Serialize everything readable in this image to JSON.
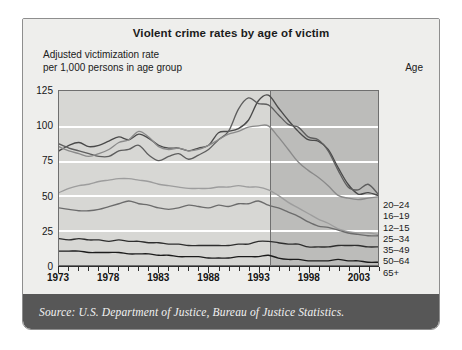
{
  "chart_data": {
    "type": "line",
    "title": "Violent crime rates by age of victim",
    "subtitle": "Adjusted victimization rate\nper 1,000 persons in age group",
    "legend_title": "Age",
    "legend_position": "right",
    "source": "Source: U.S. Department of Justice, Bureau of Justice Statistics.",
    "xlabel": "",
    "ylabel": "Adjusted victimization rate per 1,000 persons in age group",
    "xlim": [
      1973,
      2005
    ],
    "ylim": [
      0,
      125
    ],
    "yticks": [
      0,
      25,
      50,
      75,
      100,
      125
    ],
    "ytick_labels": [
      "0",
      "25",
      "50",
      "75",
      "100",
      "125"
    ],
    "xticks": [
      1973,
      1978,
      1983,
      1988,
      1993,
      1998,
      2003
    ],
    "xtick_labels": [
      "1973",
      "1978",
      "1983",
      "1988",
      "1993",
      "1998",
      "2003"
    ],
    "grid": "horizontal-white",
    "shaded_split_year": 1993,
    "x": [
      1973,
      1974,
      1975,
      1976,
      1977,
      1978,
      1979,
      1980,
      1981,
      1982,
      1983,
      1984,
      1985,
      1986,
      1987,
      1988,
      1989,
      1990,
      1991,
      1992,
      1993,
      1994,
      1995,
      1996,
      1997,
      1998,
      1999,
      2000,
      2001,
      2002,
      2003,
      2004,
      2005
    ],
    "series": [
      {
        "name": "20-24",
        "color": "#4a4a4a",
        "values": [
          82,
          86,
          88,
          85,
          86,
          89,
          92,
          90,
          94,
          91,
          86,
          84,
          84,
          82,
          84,
          86,
          95,
          96,
          98,
          104,
          118,
          122,
          113,
          104,
          96,
          90,
          89,
          83,
          70,
          58,
          51,
          52,
          50
        ]
      },
      {
        "name": "16-19",
        "color": "#5e5e5e",
        "values": [
          87,
          84,
          82,
          80,
          78,
          78,
          82,
          83,
          86,
          79,
          75,
          78,
          80,
          76,
          79,
          83,
          90,
          96,
          112,
          120,
          116,
          115,
          108,
          101,
          99,
          92,
          90,
          82,
          68,
          56,
          54,
          58,
          51
        ]
      },
      {
        "name": "12-15",
        "color": "#8a8a8a",
        "values": [
          85,
          82,
          80,
          78,
          80,
          83,
          88,
          90,
          96,
          92,
          85,
          83,
          84,
          82,
          83,
          86,
          90,
          94,
          96,
          99,
          100,
          100,
          92,
          83,
          74,
          68,
          63,
          57,
          50,
          48,
          47,
          48,
          49
        ]
      },
      {
        "name": "25-34",
        "color": "#9d9d9d",
        "values": [
          52,
          55,
          57,
          58,
          60,
          61,
          62,
          62,
          61,
          60,
          58,
          57,
          56,
          55,
          55,
          55,
          56,
          56,
          57,
          56,
          56,
          54,
          50,
          45,
          41,
          37,
          33,
          30,
          26,
          24,
          23,
          23,
          22
        ]
      },
      {
        "name": "35-49",
        "color": "#6c6c6c",
        "values": [
          41,
          40,
          39,
          39,
          40,
          42,
          44,
          46,
          44,
          43,
          41,
          40,
          41,
          43,
          42,
          41,
          43,
          42,
          44,
          44,
          46,
          43,
          41,
          38,
          35,
          31,
          28,
          27,
          25,
          23,
          22,
          21,
          21
        ]
      },
      {
        "name": "50-64",
        "color": "#2e2e2e",
        "values": [
          19,
          18,
          19,
          18,
          18,
          17,
          18,
          17,
          17,
          16,
          16,
          15,
          15,
          14,
          14,
          14,
          14,
          14,
          15,
          15,
          17,
          17,
          16,
          15,
          15,
          13,
          13,
          13,
          14,
          14,
          14,
          13,
          13
        ]
      },
      {
        "name": "65+",
        "color": "#1c1c1c",
        "values": [
          10,
          10,
          10,
          9,
          9,
          9,
          9,
          8,
          8,
          8,
          7,
          7,
          6,
          6,
          6,
          5,
          5,
          5,
          6,
          6,
          6,
          7,
          5,
          4,
          4,
          3,
          3,
          3,
          4,
          3,
          3,
          2,
          2
        ]
      }
    ]
  }
}
